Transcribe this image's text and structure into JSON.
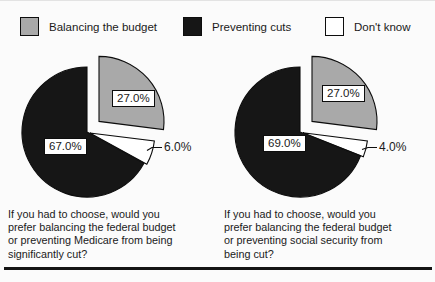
{
  "page": {
    "background": "#fbfbfb",
    "text_color": "#1a1a1a"
  },
  "legend": {
    "position": "top",
    "items": [
      {
        "label": "Balancing the budget",
        "color": "#a9a9a9"
      },
      {
        "label": "Preventing cuts",
        "color": "#161616"
      },
      {
        "label": "Don't know",
        "color": "#ffffff"
      }
    ]
  },
  "chart_data": [
    {
      "type": "pie",
      "title": "",
      "caption": "If you had to choose, would you\nprefer balancing the federal budget\nor preventing Medicare from being\nsignificantly cut?",
      "start_angle_deg": 0,
      "direction": "clockwise",
      "slices": [
        {
          "label": "Balancing the budget",
          "value": 27.0,
          "display": "27.0%",
          "color": "#a9a9a9",
          "exploded": true,
          "explode_px": 16
        },
        {
          "label": "Don't know",
          "value": 6.0,
          "display": "6.0%",
          "color": "#ffffff",
          "exploded": false,
          "explode_px": 3
        },
        {
          "label": "Preventing cuts",
          "value": 67.0,
          "display": "67.0%",
          "color": "#161616",
          "exploded": false,
          "explode_px": 0
        }
      ]
    },
    {
      "type": "pie",
      "title": "",
      "caption": "If you had to choose, would you\nprefer balancing the federal budget\nor preventing social security from\nbeing cut?",
      "start_angle_deg": 0,
      "direction": "clockwise",
      "slices": [
        {
          "label": "Balancing the budget",
          "value": 27.0,
          "display": "27.0%",
          "color": "#a9a9a9",
          "exploded": true,
          "explode_px": 16
        },
        {
          "label": "Don't know",
          "value": 4.0,
          "display": "4.0%",
          "color": "#ffffff",
          "exploded": false,
          "explode_px": 3
        },
        {
          "label": "Preventing cuts",
          "value": 69.0,
          "display": "69.0%",
          "color": "#161616",
          "exploded": false,
          "explode_px": 0
        }
      ]
    }
  ]
}
